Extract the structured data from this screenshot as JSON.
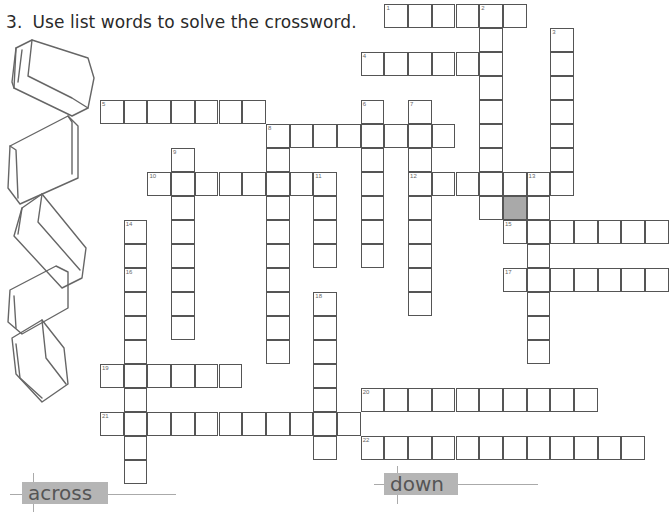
{
  "instruction": {
    "number": "3.",
    "text": "Use list words to solve the crossword."
  },
  "section_labels": {
    "across": "across",
    "down": "down"
  },
  "colors": {
    "grid_line": "#555555",
    "shaded_cell": "#a9a9a9",
    "label_bg": "#b5b5b5",
    "label_text": "#555555"
  },
  "illustration": "stack-of-books-icon",
  "crossword": {
    "cell_size": [
      23.7,
      24
    ],
    "origin": [
      100,
      4
    ],
    "words": [
      {
        "num": "1",
        "dir": "across",
        "row": 0,
        "col": 12,
        "len": 6
      },
      {
        "num": "2",
        "dir": "down",
        "row": 0,
        "col": 16,
        "len": 9
      },
      {
        "num": "3",
        "dir": "down",
        "row": 1,
        "col": 19,
        "len": 7
      },
      {
        "num": "4",
        "dir": "across",
        "row": 2,
        "col": 11,
        "len": 6
      },
      {
        "num": "5",
        "dir": "across",
        "row": 4,
        "col": 0,
        "len": 7
      },
      {
        "num": "6",
        "dir": "down",
        "row": 4,
        "col": 11,
        "len": 7
      },
      {
        "num": "7",
        "dir": "down",
        "row": 4,
        "col": 13,
        "len": 9
      },
      {
        "num": "8",
        "dir": "across",
        "row": 5,
        "col": 7,
        "len": 8
      },
      {
        "num": "8",
        "dir": "down",
        "row": 5,
        "col": 7,
        "len": 10
      },
      {
        "num": "9",
        "dir": "down",
        "row": 6,
        "col": 3,
        "len": 8
      },
      {
        "num": "10",
        "dir": "across",
        "row": 7,
        "col": 2,
        "len": 8
      },
      {
        "num": "11",
        "dir": "down",
        "row": 7,
        "col": 9,
        "len": 4
      },
      {
        "num": "12",
        "dir": "across",
        "row": 7,
        "col": 13,
        "len": 7
      },
      {
        "num": "13",
        "dir": "down",
        "row": 7,
        "col": 18,
        "len": 8
      },
      {
        "num": "14",
        "dir": "down",
        "row": 9,
        "col": 1,
        "len": 11
      },
      {
        "num": "15",
        "dir": "across",
        "row": 9,
        "col": 17,
        "len": 7
      },
      {
        "num": "16",
        "dir": "label",
        "row": 11,
        "col": 1,
        "len": 1
      },
      {
        "num": "17",
        "dir": "across",
        "row": 11,
        "col": 17,
        "len": 7
      },
      {
        "num": "18",
        "dir": "down",
        "row": 12,
        "col": 9,
        "len": 7
      },
      {
        "num": "19",
        "dir": "across",
        "row": 15,
        "col": 0,
        "len": 6
      },
      {
        "num": "20",
        "dir": "across",
        "row": 16,
        "col": 11,
        "len": 10
      },
      {
        "num": "21",
        "dir": "across",
        "row": 17,
        "col": 0,
        "len": 11
      },
      {
        "num": "22",
        "dir": "across",
        "row": 18,
        "col": 11,
        "len": 12
      }
    ],
    "shaded_cells": [
      {
        "row": 8,
        "col": 17
      }
    ]
  }
}
